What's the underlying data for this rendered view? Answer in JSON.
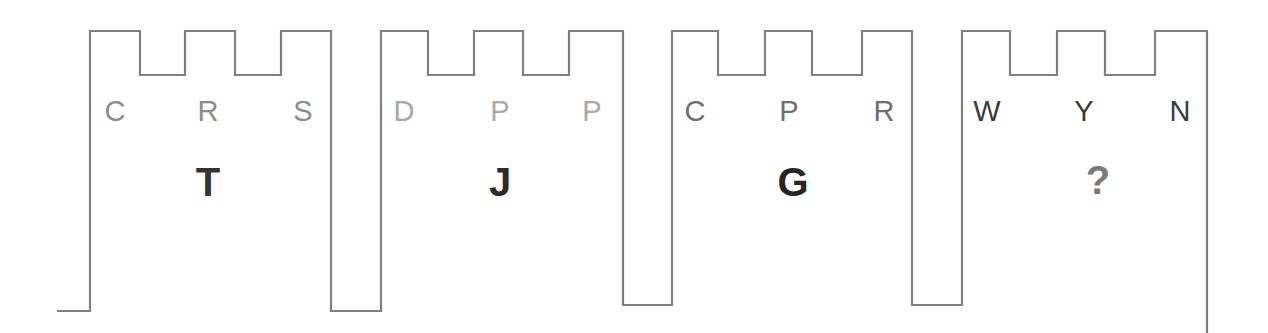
{
  "canvas": {
    "width": 1268,
    "height": 333,
    "background": "#ffffff"
  },
  "wave": {
    "stroke_color": "#808080",
    "stroke_width": 2.2,
    "description": "square-wave / castellated outline spanning four groups",
    "levels": {
      "crenel_top_y": 31,
      "crenel_notch_y": 75,
      "group_baseline_y": 311,
      "gap_baseline_y": 305
    },
    "path": "M 57 311 L 90 311 L 90 31 L 140 31 L 140 75 L 185 75 L 185 31 L 235 31 L 235 75 L 281 75 L 281 31 L 331 31 L 331 311 L 381 311 L 381 31 L 428 31 L 428 75 L 474 75 L 474 31 L 523 31 L 523 75 L 569 75 L 569 31 L 623 31 L 623 305 L 672 305 L 672 31 L 718 31 L 718 75 L 765 75 L 765 31 L 812 31 L 812 75 L 862 75 L 862 31 L 912 31 L 912 305 L 962 305 L 962 31 L 1010 31 L 1010 75 L 1057 75 L 1057 31 L 1105 31 L 1105 75 L 1155 75 L 1155 31 L 1207 31 L 1207 333"
  },
  "groups": [
    {
      "id": "group-1",
      "big_label": "T",
      "big_label_color": "#333333",
      "big_label_x": 208,
      "big_label_y": 162,
      "small_label_color": "#8c8c8c",
      "small_labels": [
        {
          "text": "C",
          "x": 115,
          "y": 97
        },
        {
          "text": "R",
          "x": 208,
          "y": 97
        },
        {
          "text": "S",
          "x": 303,
          "y": 97
        }
      ]
    },
    {
      "id": "group-2",
      "big_label": "J",
      "big_label_color": "#2b2b2b",
      "big_label_x": 500,
      "big_label_y": 162,
      "small_label_color": "#a8a8a8",
      "small_labels": [
        {
          "text": "D",
          "x": 404,
          "y": 97
        },
        {
          "text": "P",
          "x": 500,
          "y": 97
        },
        {
          "text": "P",
          "x": 592,
          "y": 97
        }
      ]
    },
    {
      "id": "group-3",
      "big_label": "G",
      "big_label_color": "#262626",
      "big_label_x": 793,
      "big_label_y": 162,
      "small_label_color": "#6e6e6e",
      "small_labels": [
        {
          "text": "C",
          "x": 695,
          "y": 97
        },
        {
          "text": "P",
          "x": 789,
          "y": 97
        },
        {
          "text": "R",
          "x": 884,
          "y": 97
        }
      ]
    },
    {
      "id": "group-4",
      "big_label": "?",
      "big_label_color": "#7a7a7a",
      "big_label_x": 1098,
      "big_label_y": 160,
      "small_label_color": "#3a3a3a",
      "small_labels": [
        {
          "text": "W",
          "x": 987,
          "y": 97
        },
        {
          "text": "Y",
          "x": 1084,
          "y": 97
        },
        {
          "text": "N",
          "x": 1180,
          "y": 97
        }
      ]
    }
  ]
}
